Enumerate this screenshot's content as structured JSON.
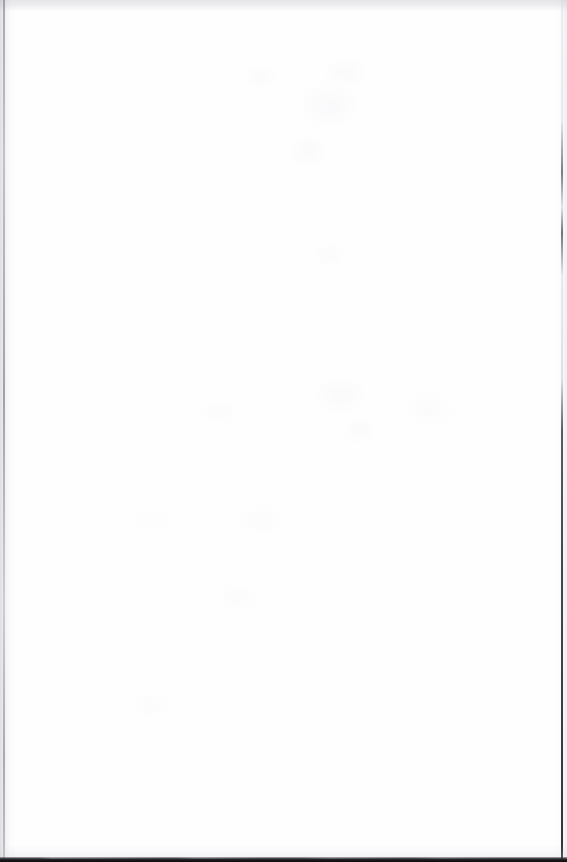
{
  "page": {
    "kind": "scanned-page",
    "content_state": "blank",
    "content_text": "",
    "visible_text_elements": [],
    "width_px": 567,
    "height_px": 862,
    "orientation": "portrait",
    "accessible_description": "Blank scanned page"
  },
  "colors": {
    "paper": "#fefeff",
    "page_background": "#ffffff",
    "top_edge_band": "#e6e6e9",
    "left_gutter_rule": "#6e6e78",
    "right_edge_rule": "#37373f",
    "bottom_edge_band": "#141416",
    "showthrough_tint": "#78788c"
  },
  "artifacts": [
    {
      "name": "top-edge-band",
      "description": "Light gray scanner band across the top edge",
      "edge": "top",
      "thickness_px": 11,
      "color": "#e6e6e9"
    },
    {
      "name": "left-gutter-shading",
      "description": "Soft gray binding-gutter wash along the left margin",
      "edge": "left",
      "thickness_px": 16,
      "color": "#96969e"
    },
    {
      "name": "left-edge-rule",
      "description": "Thin dark vertical page-edge rule inside the gutter",
      "edge": "left",
      "offset_px": 3,
      "thickness_px": 2,
      "color": "#6e6e78"
    },
    {
      "name": "right-edge-rule",
      "description": "Faint intermittent vertical trim-edge rule, darkening toward the bottom",
      "edge": "right",
      "offset_px": 4,
      "thickness_px": 2,
      "color": "#37373f"
    },
    {
      "name": "bottom-edge-band",
      "description": "Near-black band along the bottom edge of the scan bed",
      "edge": "bottom",
      "thickness_px": 5,
      "color": "#141416"
    },
    {
      "name": "show-through-mottling",
      "description": "Very faint bleed-through blotches from the reverse leaf; no legible characters",
      "edge": "none",
      "color": "#fcfcfd"
    }
  ]
}
